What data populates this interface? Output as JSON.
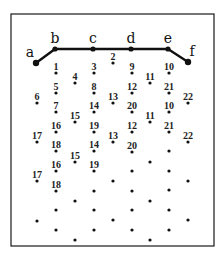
{
  "frame": {
    "x": 11,
    "y": 14,
    "width": 203,
    "height": 232
  },
  "path": {
    "nodes": [
      {
        "label": "a",
        "x": 36,
        "y": 63
      },
      {
        "label": "b",
        "x": 55,
        "y": 49
      },
      {
        "label": "c",
        "x": 93,
        "y": 49
      },
      {
        "label": "d",
        "x": 131,
        "y": 49
      },
      {
        "label": "e",
        "x": 168,
        "y": 49
      },
      {
        "label": "f",
        "x": 188,
        "y": 62
      }
    ]
  },
  "points": [
    {
      "x": 56,
      "y": 73,
      "label": "1"
    },
    {
      "x": 56,
      "y": 93,
      "label": "5"
    },
    {
      "x": 56,
      "y": 112,
      "label": "7"
    },
    {
      "x": 56,
      "y": 132,
      "label": "16"
    },
    {
      "x": 56,
      "y": 151,
      "label": "18"
    },
    {
      "x": 56,
      "y": 171,
      "label": "16"
    },
    {
      "x": 56,
      "y": 191,
      "label": "18"
    },
    {
      "x": 56,
      "y": 210,
      "label": ""
    },
    {
      "x": 56,
      "y": 230,
      "label": ""
    },
    {
      "x": 75,
      "y": 83,
      "label": "4"
    },
    {
      "x": 75,
      "y": 122,
      "label": "15"
    },
    {
      "x": 75,
      "y": 162,
      "label": "15"
    },
    {
      "x": 75,
      "y": 201,
      "label": ""
    },
    {
      "x": 75,
      "y": 240,
      "label": ""
    },
    {
      "x": 94,
      "y": 73,
      "label": "3"
    },
    {
      "x": 94,
      "y": 93,
      "label": "8"
    },
    {
      "x": 94,
      "y": 112,
      "label": "14"
    },
    {
      "x": 94,
      "y": 132,
      "label": "19"
    },
    {
      "x": 94,
      "y": 151,
      "label": "14"
    },
    {
      "x": 94,
      "y": 171,
      "label": "19"
    },
    {
      "x": 94,
      "y": 191,
      "label": ""
    },
    {
      "x": 94,
      "y": 210,
      "label": ""
    },
    {
      "x": 94,
      "y": 230,
      "label": ""
    },
    {
      "x": 113,
      "y": 63,
      "label": "2"
    },
    {
      "x": 113,
      "y": 103,
      "label": "13"
    },
    {
      "x": 113,
      "y": 142,
      "label": "13"
    },
    {
      "x": 113,
      "y": 181,
      "label": ""
    },
    {
      "x": 113,
      "y": 220,
      "label": ""
    },
    {
      "x": 132,
      "y": 73,
      "label": "9"
    },
    {
      "x": 132,
      "y": 93,
      "label": "12"
    },
    {
      "x": 132,
      "y": 112,
      "label": "20"
    },
    {
      "x": 132,
      "y": 132,
      "label": "12"
    },
    {
      "x": 132,
      "y": 152,
      "label": "20"
    },
    {
      "x": 132,
      "y": 171,
      "label": ""
    },
    {
      "x": 132,
      "y": 191,
      "label": ""
    },
    {
      "x": 132,
      "y": 210,
      "label": ""
    },
    {
      "x": 132,
      "y": 230,
      "label": ""
    },
    {
      "x": 150,
      "y": 83,
      "label": "11"
    },
    {
      "x": 150,
      "y": 122,
      "label": "11"
    },
    {
      "x": 150,
      "y": 162,
      "label": ""
    },
    {
      "x": 150,
      "y": 201,
      "label": ""
    },
    {
      "x": 150,
      "y": 240,
      "label": ""
    },
    {
      "x": 169,
      "y": 73,
      "label": "10"
    },
    {
      "x": 169,
      "y": 93,
      "label": "21"
    },
    {
      "x": 169,
      "y": 112,
      "label": "10"
    },
    {
      "x": 169,
      "y": 132,
      "label": "21"
    },
    {
      "x": 169,
      "y": 151,
      "label": ""
    },
    {
      "x": 169,
      "y": 171,
      "label": ""
    },
    {
      "x": 169,
      "y": 190,
      "label": ""
    },
    {
      "x": 169,
      "y": 210,
      "label": ""
    },
    {
      "x": 169,
      "y": 230,
      "label": ""
    },
    {
      "x": 188,
      "y": 103,
      "label": "22"
    },
    {
      "x": 188,
      "y": 142,
      "label": "22"
    },
    {
      "x": 188,
      "y": 181,
      "label": ""
    },
    {
      "x": 188,
      "y": 220,
      "label": ""
    },
    {
      "x": 37,
      "y": 103,
      "label": "6"
    },
    {
      "x": 37,
      "y": 142,
      "label": "17"
    },
    {
      "x": 37,
      "y": 181,
      "label": "17"
    },
    {
      "x": 37,
      "y": 221,
      "label": ""
    }
  ]
}
